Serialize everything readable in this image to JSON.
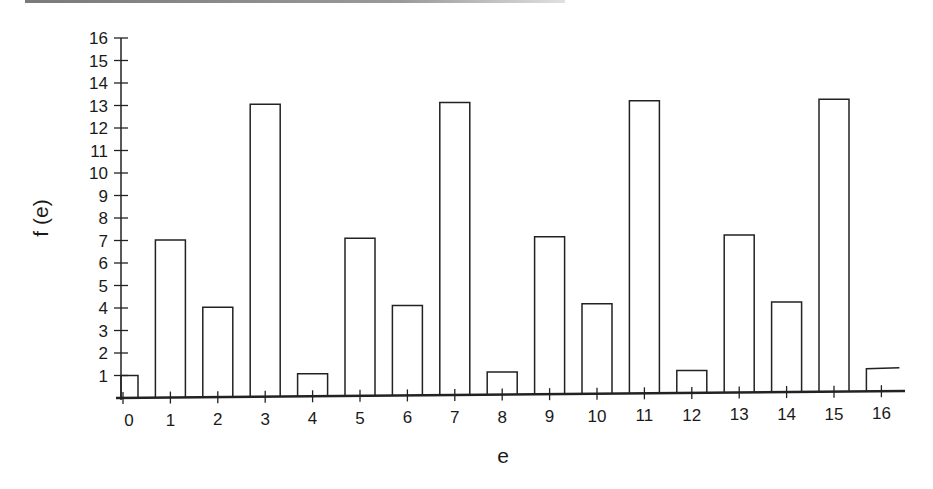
{
  "chart_data": {
    "type": "bar",
    "title": "",
    "xlabel": "e",
    "ylabel": "f (e)",
    "categories": [
      "0",
      "1",
      "2",
      "3",
      "4",
      "5",
      "6",
      "7",
      "8",
      "9",
      "10",
      "11",
      "12",
      "13",
      "14",
      "15",
      "16"
    ],
    "values": [
      1,
      7,
      4,
      13,
      1,
      7,
      4,
      13,
      1,
      7,
      4,
      13,
      1,
      7,
      4,
      13,
      1
    ],
    "ylim": [
      0,
      16
    ],
    "yticks": [
      "1",
      "2",
      "3",
      "4",
      "5",
      "6",
      "7",
      "8",
      "9",
      "10",
      "11",
      "12",
      "13",
      "14",
      "15",
      "16"
    ],
    "grid": false,
    "legend": null,
    "bar_style": "outlined, no fill",
    "colors": {
      "stroke": "#222222",
      "fill": "#ffffff"
    }
  }
}
